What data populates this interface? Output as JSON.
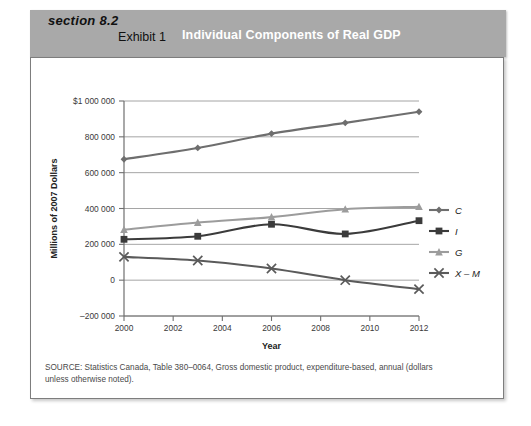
{
  "header": {
    "section_label": "section 8.2",
    "exhibit_label": "Exhibit 1",
    "exhibit_title": "Individual Components of Real GDP",
    "band_color": "#a9a9a9",
    "title_color": "#ffffff"
  },
  "source": {
    "line1": "SOURCE: Statistics Canada, Table 380–0064, Gross domestic product, expenditure-based, annual (dollars",
    "line2": "unless otherwise noted)."
  },
  "chart_data": {
    "type": "line",
    "title": "Individual Components of Real GDP",
    "xlabel": "Year",
    "ylabel": "Millions of 2007 Dollars",
    "x": [
      2000,
      2003,
      2006,
      2009,
      2012
    ],
    "xlim": [
      2000,
      2012
    ],
    "xticks": [
      2000,
      2002,
      2004,
      2006,
      2008,
      2010,
      2012
    ],
    "xtick_labels": [
      "2000",
      "2002",
      "2004",
      "2006",
      "2008",
      "2010",
      "2012"
    ],
    "ylim": [
      -200000,
      1000000
    ],
    "yticks": [
      -200000,
      0,
      200000,
      400000,
      600000,
      800000,
      1000000
    ],
    "ytick_labels": [
      "–200 000",
      "0",
      "200 000",
      "400 000",
      "600 000",
      "800 000",
      "$1 000 000"
    ],
    "grid": true,
    "grid_axis": "y",
    "legend_position": "right",
    "series": [
      {
        "name": "C",
        "marker": "diamond",
        "color": "#6e6e6e",
        "values": [
          675000,
          738000,
          818000,
          878000,
          940000
        ]
      },
      {
        "name": "I",
        "marker": "square",
        "color": "#3b3b3b",
        "values": [
          228000,
          245000,
          312000,
          258000,
          332000
        ]
      },
      {
        "name": "G",
        "marker": "triangle",
        "color": "#9c9c9c",
        "values": [
          282000,
          322000,
          352000,
          396000,
          410000
        ]
      },
      {
        "name": "X – M",
        "marker": "cross",
        "color": "#5a5a5a",
        "values": [
          130000,
          110000,
          65000,
          0,
          -50000
        ]
      }
    ]
  },
  "legend": {
    "items": [
      {
        "label": "C",
        "marker": "diamond",
        "color": "#6e6e6e"
      },
      {
        "label": "I",
        "marker": "square",
        "color": "#3b3b3b"
      },
      {
        "label": "G",
        "marker": "triangle",
        "color": "#9c9c9c"
      },
      {
        "label": "X – M",
        "marker": "cross",
        "color": "#5a5a5a"
      }
    ]
  }
}
